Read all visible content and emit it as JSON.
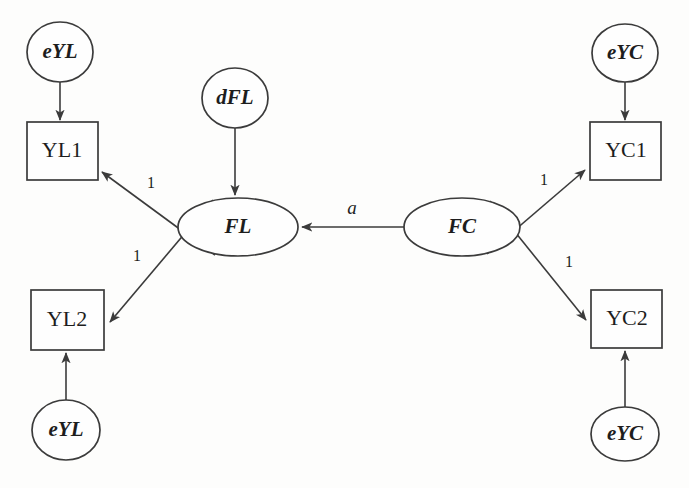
{
  "diagram": {
    "type": "sem-path-diagram",
    "title": "",
    "canvas": {
      "width": 689,
      "height": 488
    },
    "colors": {
      "background": "#fdfdfc",
      "stroke": "#3b3b3b",
      "shape_fill": "#fefefe",
      "text": "#1d1d1d"
    },
    "nodes": [
      {
        "id": "eYL1",
        "label": "eYL",
        "shape": "ellipse",
        "role": "error",
        "cx": 60,
        "cy": 52,
        "rx": 33,
        "ry": 30
      },
      {
        "id": "YL1",
        "label": "YL1",
        "shape": "rectangle",
        "role": "observed",
        "x": 27,
        "y": 122,
        "w": 71,
        "h": 58
      },
      {
        "id": "dFL",
        "label": "dFL",
        "shape": "ellipse",
        "role": "disturbance",
        "cx": 235,
        "cy": 98,
        "rx": 33,
        "ry": 30
      },
      {
        "id": "FL",
        "label": "FL",
        "shape": "ellipse",
        "role": "latent",
        "cx": 238,
        "cy": 227,
        "rx": 60,
        "ry": 29
      },
      {
        "id": "FC",
        "label": "FC",
        "shape": "ellipse",
        "role": "latent",
        "cx": 462,
        "cy": 227,
        "rx": 58,
        "ry": 29
      },
      {
        "id": "eYC1",
        "label": "eYC",
        "shape": "ellipse",
        "role": "error",
        "cx": 625,
        "cy": 53,
        "rx": 33,
        "ry": 29
      },
      {
        "id": "YC1",
        "label": "YC1",
        "shape": "rectangle",
        "role": "observed",
        "x": 590,
        "y": 122,
        "w": 71,
        "h": 58
      },
      {
        "id": "YL2",
        "label": "YL2",
        "shape": "rectangle",
        "role": "observed",
        "x": 31,
        "y": 290,
        "w": 73,
        "h": 60
      },
      {
        "id": "eYL2",
        "label": "eYL",
        "shape": "ellipse",
        "role": "error",
        "cx": 66,
        "cy": 430,
        "rx": 34,
        "ry": 30
      },
      {
        "id": "YC2",
        "label": "YC2",
        "shape": "rectangle",
        "role": "observed",
        "x": 591,
        "y": 290,
        "w": 71,
        "h": 58
      },
      {
        "id": "eYC2",
        "label": "eYC",
        "shape": "ellipse",
        "role": "error",
        "cx": 625,
        "cy": 434,
        "rx": 34,
        "ry": 27
      }
    ],
    "edges": [
      {
        "id": "e1",
        "from": "eYL1",
        "to": "YL1",
        "label": "",
        "x1": 60,
        "y1": 82,
        "x2": 60,
        "y2": 120
      },
      {
        "id": "e2",
        "from": "dFL",
        "to": "FL",
        "label": "",
        "x1": 235,
        "y1": 128,
        "x2": 235,
        "y2": 195
      },
      {
        "id": "e3",
        "from": "FL",
        "to": "YL1",
        "label": "1",
        "x1": 215,
        "y1": 255,
        "x2": 102,
        "y2": 172,
        "lx": 151,
        "ly": 184
      },
      {
        "id": "e4",
        "from": "FL",
        "to": "YL2",
        "label": "1",
        "x1": 213,
        "y1": 200,
        "x2": 110,
        "y2": 322,
        "lx": 137,
        "ly": 257
      },
      {
        "id": "e5",
        "from": "FC",
        "to": "FL",
        "label": "a",
        "x1": 404,
        "y1": 227,
        "x2": 302,
        "y2": 227,
        "lx": 352,
        "ly": 210
      },
      {
        "id": "e6",
        "from": "FC",
        "to": "YC1",
        "label": "1",
        "x1": 487,
        "y1": 254,
        "x2": 585,
        "y2": 170,
        "lx": 544,
        "ly": 181
      },
      {
        "id": "e7",
        "from": "FC",
        "to": "YC2",
        "label": "1",
        "x1": 490,
        "y1": 201,
        "x2": 586,
        "y2": 320,
        "lx": 569,
        "ly": 263
      },
      {
        "id": "e8",
        "from": "eYC1",
        "to": "YC1",
        "label": "",
        "x1": 625,
        "y1": 82,
        "x2": 625,
        "y2": 120
      },
      {
        "id": "e9",
        "from": "eYL2",
        "to": "YL2",
        "label": "",
        "x1": 66,
        "y1": 400,
        "x2": 66,
        "y2": 353
      },
      {
        "id": "e10",
        "from": "eYC2",
        "to": "YC2",
        "label": "",
        "x1": 625,
        "y1": 407,
        "x2": 625,
        "y2": 351
      }
    ],
    "edge_labels": {
      "loading_fixed": "1",
      "structural_param": "a"
    }
  }
}
